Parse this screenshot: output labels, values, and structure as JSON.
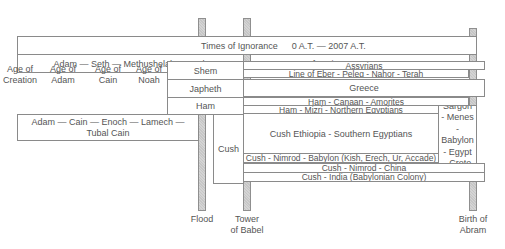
{
  "timeline": {
    "top_row": {
      "left_label": "Times of Ignorance",
      "right_label": "0 A.T. — 2007 A.T."
    },
    "lineage_seth": "Adam — Seth — Methushelah -- Noah",
    "age_of_nations": "Age of Nations",
    "ages": [
      {
        "line1": "Age of",
        "line2": "Creation"
      },
      {
        "line1": "Age of",
        "line2": "Adam"
      },
      {
        "line1": "Age of",
        "line2": "Cain"
      },
      {
        "line1": "Age of",
        "line2": "Noah"
      }
    ],
    "sons_of_noah": [
      "Shem",
      "Japheth",
      "Ham"
    ],
    "lineage_cain": "Adam — Cain — Enoch — Lamech — Tubal Cain",
    "cush": "Cush",
    "nations": {
      "assyrians": "Assyrians",
      "eber": "Line of Eber - Peleg - Nahor - Terah",
      "greece": "Greece",
      "canaan": "Ham - Canaan - Amorites",
      "mizri": "Ham - Mizri - Northern Egyptians",
      "ethiopia": "Cush Ethiopia - Southern Egyptians",
      "sargon": "Sargon - Menes - Babylon - Egypt - Crete",
      "babylon": "Cush - Nimrod - Babylon (Kish, Erech, Ur, Accade)",
      "china": "Cush - Nimrod - China",
      "india": "Cush - India (Babylonian Colony)"
    },
    "markers": [
      {
        "line1": "Flood",
        "line2": ""
      },
      {
        "line1": "Tower",
        "line2": "of Babel"
      },
      {
        "line1": "Birth of",
        "line2": "Abram"
      }
    ]
  },
  "colors": {
    "border": "#8a8a8a",
    "pillar": "#cccccc",
    "text": "#555555"
  }
}
